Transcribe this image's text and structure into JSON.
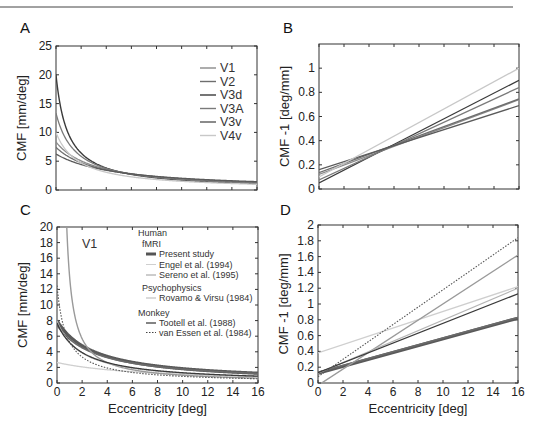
{
  "figure": {
    "panels": [
      "A",
      "B",
      "C",
      "D"
    ]
  },
  "chart_data": [
    {
      "panel": "A",
      "type": "line",
      "title": "",
      "xlabel": "",
      "ylabel": "CMF [mm/deg]",
      "xlim": [
        0,
        16
      ],
      "ylim": [
        0,
        25
      ],
      "xticks": [
        0,
        2,
        4,
        6,
        8,
        10,
        12,
        14,
        16
      ],
      "yticks": [
        0,
        5,
        10,
        15,
        20,
        25
      ],
      "show_xtick_labels": false,
      "legend": [
        "V1",
        "V2",
        "V3d",
        "V3A",
        "V3v",
        "V4v"
      ],
      "legend_position": "upper right",
      "model": "CMF = 1/(a + b*E)",
      "series": [
        {
          "name": "V1",
          "a": 0.12,
          "b": 0.039,
          "color": "#8a8a8a",
          "width": 1.3
        },
        {
          "name": "V2",
          "a": 0.135,
          "b": 0.038,
          "color": "#6e6e6e",
          "width": 1.3
        },
        {
          "name": "V3d",
          "a": 0.05,
          "b": 0.053,
          "color": "#3a3a3a",
          "width": 1.4
        },
        {
          "name": "V3A",
          "a": 0.075,
          "b": 0.048,
          "color": "#7a7a7a",
          "width": 1.3
        },
        {
          "name": "V3v",
          "a": 0.16,
          "b": 0.033,
          "color": "#5a5a5a",
          "width": 1.3
        },
        {
          "name": "V4v",
          "a": 0.1,
          "b": 0.0563,
          "color": "#c8c8c8",
          "width": 1.3
        }
      ]
    },
    {
      "panel": "B",
      "type": "line",
      "xlabel": "",
      "ylabel": "CMF -1 [deg/mm]",
      "xlim": [
        0,
        16
      ],
      "ylim": [
        0,
        1.2
      ],
      "xticks": [
        0,
        2,
        4,
        6,
        8,
        10,
        12,
        14,
        16
      ],
      "yticks": [
        0,
        0.2,
        0.4,
        0.6,
        0.8,
        1
      ],
      "ytick_labels": [
        "0",
        "0.2",
        "0.4",
        "0.6",
        "0.8",
        "1"
      ],
      "show_xtick_labels": false,
      "series": [
        {
          "name": "V1",
          "x": [
            0,
            16
          ],
          "y": [
            0.12,
            0.74
          ]
        },
        {
          "name": "V2",
          "x": [
            0,
            16
          ],
          "y": [
            0.135,
            0.745
          ]
        },
        {
          "name": "V3d",
          "x": [
            0,
            16
          ],
          "y": [
            0.05,
            0.9
          ]
        },
        {
          "name": "V3A",
          "x": [
            0,
            16
          ],
          "y": [
            0.075,
            0.84
          ]
        },
        {
          "name": "V3v",
          "x": [
            0,
            16
          ],
          "y": [
            0.16,
            0.69
          ]
        },
        {
          "name": "V4v",
          "x": [
            0,
            16
          ],
          "y": [
            0.1,
            1.0
          ]
        }
      ]
    },
    {
      "panel": "C",
      "type": "line",
      "annotation": "V1",
      "xlabel": "Eccentricity [deg]",
      "ylabel": "CMF [mm/deg]",
      "xlim": [
        0,
        16
      ],
      "ylim": [
        0,
        20
      ],
      "xticks": [
        0,
        2,
        4,
        6,
        8,
        10,
        12,
        14,
        16
      ],
      "yticks": [
        0,
        2,
        4,
        6,
        8,
        10,
        12,
        14,
        16,
        18,
        20
      ],
      "legend_groups": [
        {
          "heading": "Human",
          "subgroups": [
            {
              "heading": "fMRI",
              "entries": [
                "Present study",
                "Engel et al. (1994)",
                "Sereno et al. (1995)"
              ]
            },
            {
              "heading": "Psychophysics",
              "entries": [
                "Rovamo & Virsu (1984)"
              ]
            }
          ]
        },
        {
          "heading": "Monkey",
          "entries": [
            "Tootell et al. (1988)",
            "van Essen et al. (1984)"
          ]
        }
      ],
      "model": "CMF = 1/(a + b*E)",
      "series": [
        {
          "name": "Present study",
          "a": 0.125,
          "b": 0.042,
          "color": "#5a5a5a",
          "width": 3.2,
          "dash": ""
        },
        {
          "name": "Present study (2)",
          "a": 0.135,
          "b": 0.043,
          "color": "#6a6a6a",
          "width": 1.6,
          "dash": ""
        },
        {
          "name": "Engel et al. (1994)",
          "a": 0.38,
          "b": 0.052,
          "color": "#cfcfcf",
          "width": 1.3,
          "dash": ""
        },
        {
          "name": "Sereno et al. (1995)",
          "a": -0.03,
          "b": 0.103,
          "color": "#9a9a9a",
          "width": 1.4,
          "dash": ""
        },
        {
          "name": "Rovamo & Virsu (1984)",
          "a": 0.125,
          "b": 0.067,
          "color": "#b5b5b5",
          "width": 1.2,
          "dash": ""
        },
        {
          "name": "Tootell et al. (1988)",
          "a": 0.13,
          "b": 0.063,
          "color": "#3a3a3a",
          "width": 1.3,
          "dash": ""
        },
        {
          "name": "van Essen et al. (1984)",
          "a": 0.08,
          "b": 0.11,
          "color": "#555555",
          "width": 1.1,
          "dash": "1.5,1.5"
        }
      ]
    },
    {
      "panel": "D",
      "type": "line",
      "xlabel": "Eccentricity [deg]",
      "ylabel": "CMF -1 [deg/mm]",
      "xlim": [
        0,
        16
      ],
      "ylim": [
        0,
        2
      ],
      "xticks": [
        0,
        2,
        4,
        6,
        8,
        10,
        12,
        14,
        16
      ],
      "yticks": [
        0,
        0.2,
        0.4,
        0.6,
        0.8,
        1,
        1.2,
        1.4,
        1.6,
        1.8,
        2
      ],
      "ytick_labels": [
        "0",
        "0.2",
        "0.4",
        "0.6",
        "0.8",
        "1",
        "1.2",
        "1.4",
        "1.6",
        "1.8",
        "2"
      ],
      "series": [
        {
          "name": "Present study",
          "x": [
            0,
            16
          ],
          "y": [
            0.125,
            0.82
          ]
        },
        {
          "name": "Present study (2)",
          "x": [
            0,
            16
          ],
          "y": [
            0.135,
            0.83
          ]
        },
        {
          "name": "Engel et al. (1994)",
          "x": [
            0,
            16
          ],
          "y": [
            0.38,
            1.22
          ]
        },
        {
          "name": "Sereno et al. (1995)",
          "x": [
            0,
            16
          ],
          "y": [
            -0.03,
            1.62
          ]
        },
        {
          "name": "Rovamo & Virsu (1984)",
          "x": [
            0,
            16
          ],
          "y": [
            0.125,
            1.2
          ]
        },
        {
          "name": "Tootell et al. (1988)",
          "x": [
            0,
            16
          ],
          "y": [
            0.13,
            1.13
          ]
        },
        {
          "name": "van Essen et al. (1984)",
          "x": [
            0,
            16
          ],
          "y": [
            0.08,
            1.84
          ]
        }
      ]
    }
  ]
}
